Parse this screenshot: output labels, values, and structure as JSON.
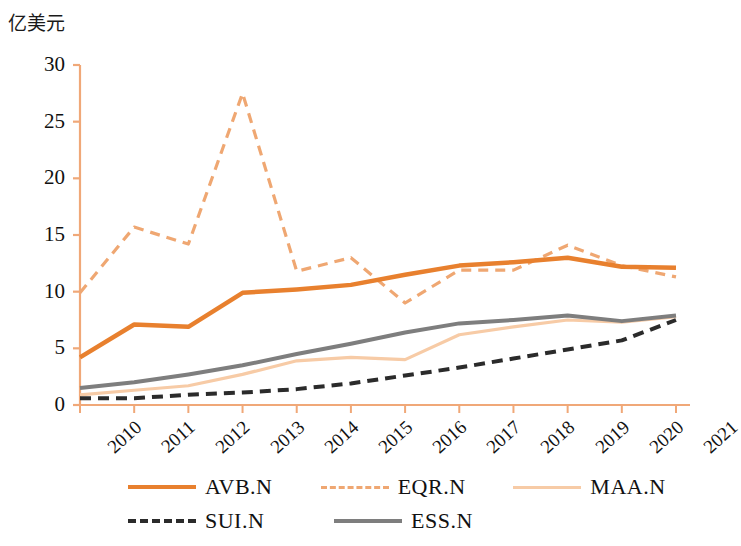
{
  "chart_data": {
    "type": "line",
    "title": "",
    "subtitle": "",
    "xlabel": "",
    "ylabel": "亿美元",
    "categories": [
      "2010",
      "2011",
      "2012",
      "2013",
      "2014",
      "2015",
      "2016",
      "2017",
      "2018",
      "2019",
      "2020",
      "2021"
    ],
    "ylim": [
      0,
      30
    ],
    "yticks": [
      0,
      5,
      10,
      15,
      20,
      25,
      30
    ],
    "grid": false,
    "legend_position": "bottom",
    "series": [
      {
        "name": "AVB.N",
        "style": "solid",
        "color": "#E8802E",
        "width": 4.5,
        "values": [
          4.2,
          7.1,
          6.9,
          9.9,
          10.2,
          10.6,
          11.5,
          12.3,
          12.6,
          13.0,
          12.2,
          12.1
        ]
      },
      {
        "name": "EQR.N",
        "style": "dashed",
        "color": "#EFA772",
        "width": 3.2,
        "values": [
          9.9,
          15.7,
          14.2,
          27.5,
          11.8,
          13.0,
          9.0,
          11.9,
          11.9,
          14.1,
          12.3,
          11.3
        ]
      },
      {
        "name": "MAA.N",
        "style": "solid",
        "color": "#F7CBA6",
        "width": 3.2,
        "values": [
          0.9,
          1.3,
          1.7,
          2.7,
          3.9,
          4.2,
          4.0,
          6.2,
          6.9,
          7.5,
          7.3,
          7.8
        ]
      },
      {
        "name": "SUI.N",
        "style": "dashed",
        "color": "#2B2B2B",
        "width": 4.0,
        "values": [
          0.6,
          0.6,
          0.9,
          1.1,
          1.4,
          1.9,
          2.6,
          3.3,
          4.1,
          4.9,
          5.7,
          7.5
        ]
      },
      {
        "name": "ESS.N",
        "style": "solid",
        "color": "#7E7E7E",
        "width": 4.0,
        "values": [
          1.5,
          2.0,
          2.7,
          3.5,
          4.5,
          5.4,
          6.4,
          7.2,
          7.5,
          7.9,
          7.4,
          7.9
        ]
      }
    ]
  },
  "axis": {
    "unit_label": "亿美元",
    "axis_color": "#F0A878",
    "tick_label_color": "#111111"
  },
  "legend": {
    "rows": [
      [
        {
          "label": "AVB.N",
          "series": "AVB.N"
        },
        {
          "label": "EQR.N",
          "series": "EQR.N"
        },
        {
          "label": "MAA.N",
          "series": "MAA.N"
        }
      ],
      [
        {
          "label": "SUI.N",
          "series": "SUI.N"
        },
        {
          "label": "ESS.N",
          "series": "ESS.N"
        }
      ]
    ]
  }
}
